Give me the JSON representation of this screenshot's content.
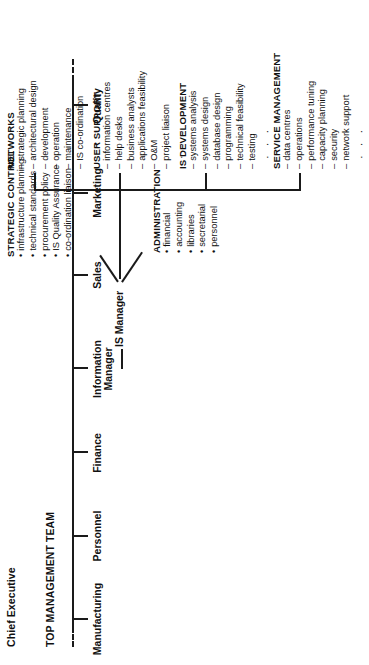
{
  "diagram": {
    "type": "organisation-chart",
    "top_label": "TOP MANAGEMENT TEAM",
    "root": "Chief Executive",
    "ellipsis": "· · ·",
    "line_color": "#1a1a1a"
  },
  "top_team": {
    "members": [
      {
        "label": "Manufacturing"
      },
      {
        "label": "Personnel"
      },
      {
        "label": "Finance"
      },
      {
        "label": "Information\nManager"
      },
      {
        "label": "Sales"
      },
      {
        "label": "Marketing"
      },
      {
        "label": "Quality"
      }
    ],
    "information_manager_line1": "Information",
    "information_manager_line2": "Manager"
  },
  "is_manager": {
    "label": "IS Manager"
  },
  "staff_units": [
    {
      "name": "ADMINISTRATION",
      "marker": "bullet",
      "items": [
        "financial",
        "accounting",
        "libraries",
        "secretarial",
        "personnel"
      ]
    },
    {
      "name": "STRATEGIC CONTROL",
      "marker": "bullet",
      "items": [
        "infrastructure planning",
        "technical standards",
        "procurement policy",
        "IS Quality Assurance",
        "co-ordination liaison"
      ]
    }
  ],
  "departments": [
    {
      "name": "SERVICE MANAGEMENT",
      "marker": "dash",
      "items": [
        "data centres",
        "operations",
        "performance tuning",
        "capacity planning",
        "security",
        "network support"
      ],
      "more": "· · ·"
    },
    {
      "name": "IS DEVELOPMENT",
      "marker": "dash",
      "items": [
        "systems analysis",
        "systems design",
        "database design",
        "programming",
        "technical feasibility",
        "testing"
      ],
      "more": "· · ·"
    },
    {
      "name": "USER SUPPORT",
      "marker": "dash",
      "items": [
        "information centres",
        "help desks",
        "business analysts",
        "applications feasibility",
        "O&M",
        "project liaison"
      ],
      "more": "· · ·"
    },
    {
      "name": "NETWORKS",
      "marker": "dash",
      "items": [
        "strategic planning",
        "architectural design",
        "development",
        "operation",
        "maintenance",
        "IS co-ordination"
      ],
      "more": "· · ·"
    }
  ]
}
